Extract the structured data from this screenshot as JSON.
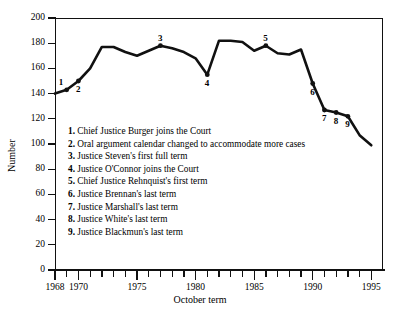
{
  "chart_data": {
    "type": "line",
    "title": "",
    "xlabel": "October term",
    "ylabel": "Number",
    "ylim": [
      0,
      200
    ],
    "xlim": [
      1968,
      1996
    ],
    "grid": false,
    "legend_position": "inside-lower-left",
    "y_ticks": [
      0,
      20,
      40,
      60,
      80,
      100,
      120,
      140,
      160,
      180,
      200
    ],
    "x_ticks": [
      1968,
      1969,
      1970,
      1971,
      1972,
      1973,
      1974,
      1975,
      1976,
      1977,
      1978,
      1979,
      1980,
      1981,
      1982,
      1983,
      1984,
      1985,
      1986,
      1987,
      1988,
      1989,
      1990,
      1991,
      1992,
      1993,
      1994,
      1995
    ],
    "x_tick_labels": [
      {
        "x": 1968,
        "label": "1968"
      },
      {
        "x": 1970,
        "label": "1970"
      },
      {
        "x": 1975,
        "label": "1975"
      },
      {
        "x": 1980,
        "label": "1980"
      },
      {
        "x": 1985,
        "label": "1985"
      },
      {
        "x": 1990,
        "label": "1990"
      },
      {
        "x": 1995,
        "label": "1995"
      }
    ],
    "x": [
      1968,
      1969,
      1970,
      1971,
      1972,
      1973,
      1974,
      1975,
      1976,
      1977,
      1978,
      1979,
      1980,
      1981,
      1982,
      1983,
      1984,
      1985,
      1986,
      1987,
      1988,
      1989,
      1990,
      1991,
      1992,
      1993,
      1994,
      1995
    ],
    "values": [
      140,
      143,
      150,
      160,
      177,
      177,
      173,
      170,
      174,
      178,
      176,
      173,
      168,
      155,
      182,
      182,
      181,
      174,
      178,
      172,
      171,
      175,
      148,
      127,
      125,
      122,
      107,
      99
    ],
    "series": [
      {
        "name": "Number of cases",
        "values": [
          140,
          143,
          150,
          160,
          177,
          177,
          173,
          170,
          174,
          178,
          176,
          173,
          168,
          155,
          182,
          182,
          181,
          174,
          178,
          172,
          171,
          175,
          148,
          127,
          125,
          122,
          107,
          99
        ]
      }
    ],
    "annotations": [
      {
        "n": "1",
        "x": 1969,
        "y": 143,
        "label": "Chief Justice Burger joins the Court"
      },
      {
        "n": "2",
        "x": 1970,
        "y": 150,
        "label": "Oral argument calendar changed to accommodate more cases"
      },
      {
        "n": "3",
        "x": 1977,
        "y": 178,
        "label": "Justice Steven's first full term"
      },
      {
        "n": "4",
        "x": 1981,
        "y": 155,
        "label": "Justice O'Connor joins the Court"
      },
      {
        "n": "5",
        "x": 1986,
        "y": 178,
        "label": "Chief Justice Rehnquist's first term"
      },
      {
        "n": "6",
        "x": 1990,
        "y": 148,
        "label": "Justice Brennan's last term"
      },
      {
        "n": "7",
        "x": 1991,
        "y": 127,
        "label": "Justice Marshall's last term"
      },
      {
        "n": "8",
        "x": 1992,
        "y": 125,
        "label": "Justice White's last term"
      },
      {
        "n": "9",
        "x": 1993,
        "y": 122,
        "label": "Justice Blackmun's last term"
      }
    ]
  },
  "legend": {
    "items": [
      {
        "num": "1.",
        "text": "Chief Justice Burger joins the Court"
      },
      {
        "num": "2.",
        "text": "Oral argument calendar changed to accommodate more cases"
      },
      {
        "num": "3.",
        "text": "Justice Steven's first full term"
      },
      {
        "num": "4.",
        "text": "Justice O'Connor joins the Court"
      },
      {
        "num": "5.",
        "text": "Chief Justice Rehnquist's first term"
      },
      {
        "num": "6.",
        "text": "Justice Brennan's last term"
      },
      {
        "num": "7.",
        "text": "Justice Marshall's last term"
      },
      {
        "num": "8.",
        "text": "Justice White's last term"
      },
      {
        "num": "9.",
        "text": "Justice Blackmun's last term"
      }
    ]
  },
  "colors": {
    "line": "#111111",
    "axis": "#111111",
    "background": "#ffffff"
  }
}
